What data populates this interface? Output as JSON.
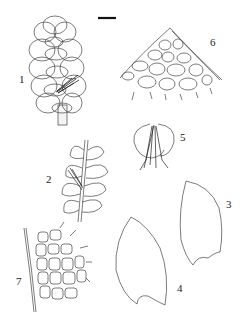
{
  "plate": {
    "scale_bar": true,
    "figures": [
      {
        "number": "1",
        "subject": "shoot with leaves (dorsal view)"
      },
      {
        "number": "2",
        "subject": "shoot with leaves (ventral view)"
      },
      {
        "number": "3",
        "subject": "leaf"
      },
      {
        "number": "4",
        "subject": "leaf"
      },
      {
        "number": "5",
        "subject": "underleaf with rhizoids"
      },
      {
        "number": "6",
        "subject": "leaf apex cells"
      },
      {
        "number": "7",
        "subject": "leaf margin cells"
      }
    ]
  },
  "labels": {
    "f1": "1",
    "f2": "2",
    "f3": "3",
    "f4": "4",
    "f5": "5",
    "f6": "6",
    "f7": "7"
  },
  "colors": {
    "ink": "#333333",
    "background": "#ffffff"
  }
}
